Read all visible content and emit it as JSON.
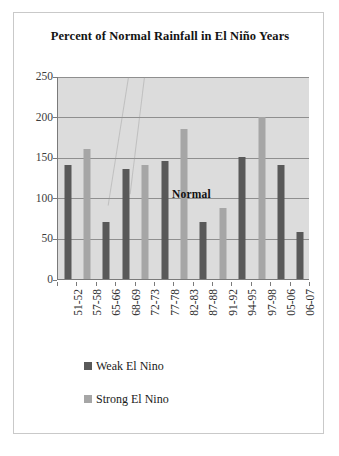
{
  "chart_data": {
    "type": "bar",
    "title": "Percent of Normal Rainfall in El Niño Years",
    "xlabel": "",
    "ylabel": "",
    "ylim": [
      0,
      250
    ],
    "yticks": [
      0,
      50,
      100,
      150,
      200,
      250
    ],
    "grid": true,
    "legend_position": "bottom-left",
    "categories": [
      "51-52",
      "57-58",
      "65-66",
      "68-69",
      "72-73",
      "77-78",
      "82-83",
      "87-88",
      "91-92",
      "94-95",
      "97-98",
      "05-06",
      "06-07"
    ],
    "series": [
      {
        "name": "Weak El Nino",
        "color": "#595959",
        "values": [
          140,
          null,
          70,
          135,
          null,
          145,
          null,
          70,
          null,
          150,
          null,
          140,
          58
        ]
      },
      {
        "name": "Strong El Nino",
        "color": "#a6a6a6",
        "values": [
          null,
          160,
          null,
          null,
          140,
          null,
          185,
          null,
          88,
          null,
          200,
          null,
          null
        ]
      }
    ],
    "bars": [
      {
        "category": "51-52",
        "value": 140,
        "series": "Weak El Nino"
      },
      {
        "category": "57-58",
        "value": 160,
        "series": "Strong El Nino"
      },
      {
        "category": "65-66",
        "value": 70,
        "series": "Weak El Nino"
      },
      {
        "category": "68-69",
        "value": 135,
        "series": "Weak El Nino"
      },
      {
        "category": "72-73",
        "value": 140,
        "series": "Strong El Nino"
      },
      {
        "category": "77-78",
        "value": 145,
        "series": "Weak El Nino"
      },
      {
        "category": "82-83",
        "value": 185,
        "series": "Strong El Nino"
      },
      {
        "category": "87-88",
        "value": 70,
        "series": "Weak El Nino"
      },
      {
        "category": "91-92",
        "value": 88,
        "series": "Strong El Nino"
      },
      {
        "category": "94-95",
        "value": 150,
        "series": "Weak El Nino"
      },
      {
        "category": "97-98",
        "value": 200,
        "series": "Strong El Nino"
      },
      {
        "category": "05-06",
        "value": 140,
        "series": "Weak El Nino"
      },
      {
        "category": "06-07",
        "value": 58,
        "series": "Weak El Nino"
      }
    ],
    "annotations": [
      {
        "text": "Normal",
        "value": 100
      }
    ],
    "colors": {
      "plot_background": "#dcdcdc",
      "gridline": "#8f8f8f",
      "axis": "#7a7a7a",
      "weak": "#595959",
      "strong": "#a6a6a6",
      "page_background": "#ffffff",
      "frame": "#c9c9c9"
    }
  },
  "legend": {
    "items": [
      {
        "label": "Weak El Nino",
        "swatch": "weak"
      },
      {
        "label": "Strong El Nino",
        "swatch": "strong"
      }
    ]
  }
}
